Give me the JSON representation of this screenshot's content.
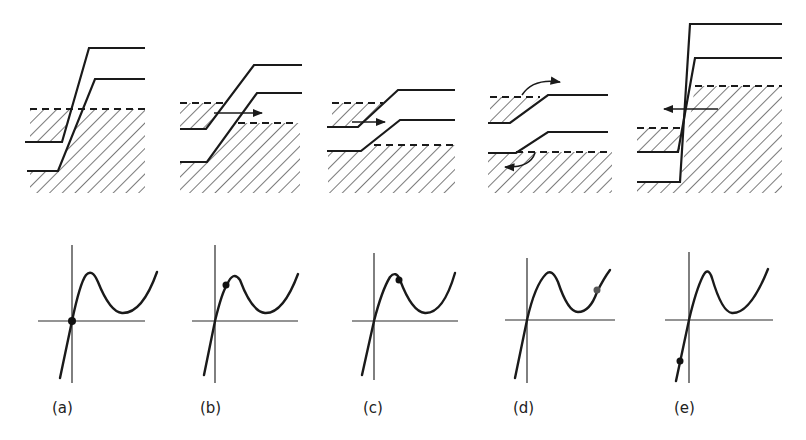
{
  "figure": {
    "panels": [
      {
        "id": "a",
        "label": "(a)",
        "condition": "zero bias, equilibrium",
        "operating_point": "origin",
        "tunneling_arrow": "none"
      },
      {
        "id": "b",
        "label": "(b)",
        "condition": "small forward bias",
        "operating_point": "rising branch below peak",
        "tunneling_arrow": "right"
      },
      {
        "id": "c",
        "label": "(c)",
        "condition": "forward bias at/after peak current",
        "operating_point": "just past peak",
        "tunneling_arrow": "right"
      },
      {
        "id": "d",
        "label": "(d)",
        "condition": "large forward bias, diffusion current",
        "operating_point": "rising branch after valley",
        "tunneling_arrow": "curved (thermal injection)"
      },
      {
        "id": "e",
        "label": "(e)",
        "condition": "reverse bias",
        "operating_point": "negative current branch",
        "tunneling_arrow": "left"
      }
    ],
    "colors": {
      "line": "#1a1a1a",
      "background": "#ffffff"
    }
  }
}
